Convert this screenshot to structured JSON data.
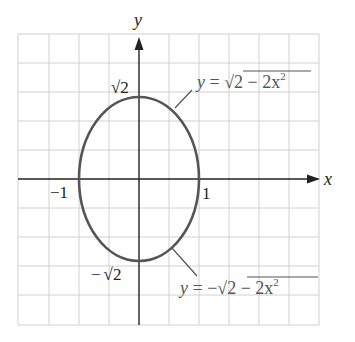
{
  "figure": {
    "axes": {
      "x_label": "x",
      "y_label": "y",
      "x_tick_neg": "−1",
      "x_tick_pos": "1",
      "y_tick_top": "√2",
      "y_tick_bottom_sign": "−",
      "y_tick_bottom": "√2"
    },
    "curves": {
      "upper": {
        "lhs": "y = ",
        "radical": "√",
        "radicand": "2 − 2x",
        "exponent": "2"
      },
      "lower": {
        "lhs": "y = −",
        "radical": "√",
        "radicand": "2 − 2x",
        "exponent": "2"
      }
    },
    "colors": {
      "grid": "#d0d0d0",
      "axis": "#222222",
      "curve": "#555555",
      "leader": "#555555"
    }
  },
  "chart_data": {
    "type": "line",
    "title": "",
    "xlabel": "x",
    "ylabel": "y",
    "grid": true,
    "xlim": [
      -2.0,
      3.0
    ],
    "ylim": [
      -2.5,
      2.5
    ],
    "series": [
      {
        "name": "y = √(2 − 2x²)",
        "x": [
          -1,
          -0.5,
          0,
          0.5,
          1
        ],
        "y": [
          0,
          1.2247,
          1.4142,
          1.2247,
          0
        ]
      },
      {
        "name": "y = −√(2 − 2x²)",
        "x": [
          -1,
          -0.5,
          0,
          0.5,
          1
        ],
        "y": [
          0,
          -1.2247,
          -1.4142,
          -1.2247,
          0
        ]
      }
    ],
    "annotations": [
      "√2",
      "−√2",
      "−1",
      "1"
    ]
  }
}
